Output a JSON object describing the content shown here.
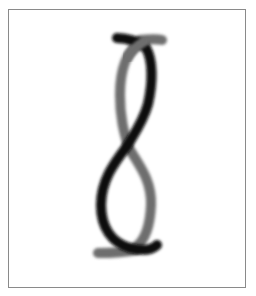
{
  "image": {
    "subject": "twisted-two-strand-figure",
    "caption": "Two intertwined strands forming a figure-eight twist",
    "frame": {
      "border_color": "#8a8a8a",
      "background": "#ffffff"
    },
    "strands": [
      {
        "name": "black-strand",
        "color": "#0a0a0a"
      },
      {
        "name": "gray-strand",
        "color": "#6e6e6e"
      }
    ]
  }
}
